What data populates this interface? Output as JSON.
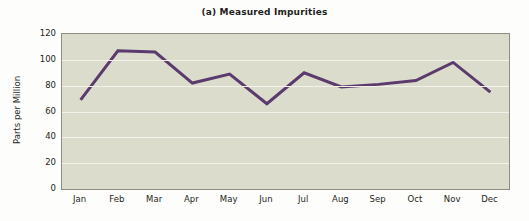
{
  "chart_data": {
    "type": "line",
    "title": "(a) Measured Impurities",
    "xlabel": "",
    "ylabel": "Parts per Million",
    "categories": [
      "Jan",
      "Feb",
      "Mar",
      "Apr",
      "May",
      "Jun",
      "Jul",
      "Aug",
      "Sep",
      "Oct",
      "Nov",
      "Dec"
    ],
    "values": [
      69,
      107,
      106,
      82,
      89,
      66,
      90,
      79,
      81,
      84,
      98,
      75
    ],
    "series": [
      {
        "name": "Measured Impurities",
        "values": [
          69,
          107,
          106,
          82,
          89,
          66,
          90,
          79,
          81,
          84,
          98,
          75
        ]
      }
    ],
    "ylim": [
      0,
      120
    ],
    "y_ticks": [
      0,
      20,
      40,
      60,
      80,
      100,
      120
    ],
    "grid": true,
    "grid_axis": "y",
    "legend": false,
    "legend_position": "none",
    "line_color": "#5b3a6e",
    "plot_background": "#dcdccd",
    "gridline_color": "#f2f2ea",
    "axis_color": "#8d8d80",
    "text_color": "#231f20",
    "figure_background": "#fdfdfc"
  }
}
